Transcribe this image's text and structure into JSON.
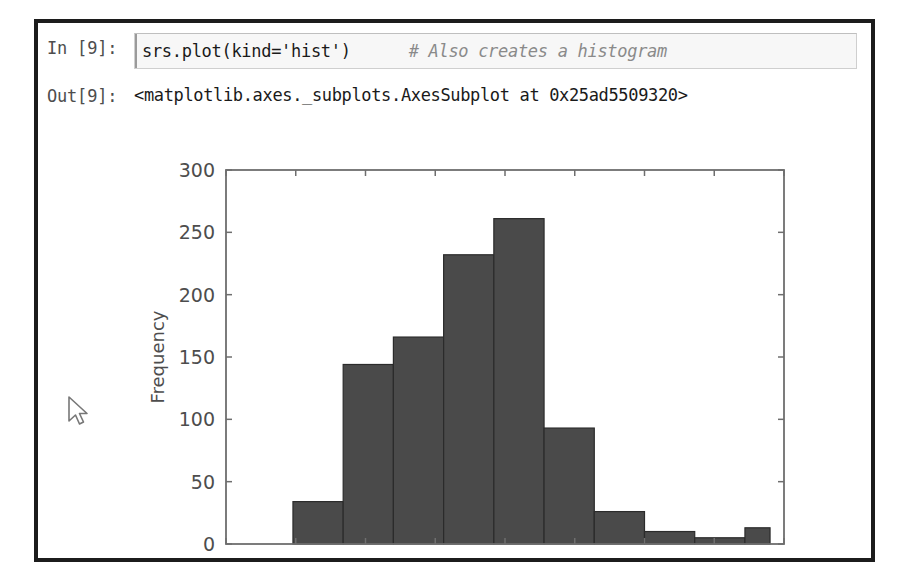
{
  "notebook": {
    "input": {
      "prompt": "In [9]:",
      "code": "srs.plot(kind='hist')",
      "comment": "# Also creates a histogram"
    },
    "output": {
      "prompt": "Out[9]:",
      "text": "<matplotlib.axes._subplots.AxesSubplot at 0x25ad5509320>"
    }
  },
  "cursor": {
    "icon": "mouse-pointer-icon"
  },
  "colors": {
    "bar_fill": "#4a4a4a",
    "bar_edge": "#2b2b2b",
    "axis": "#6e6e6e",
    "frame": "#1c1c1c",
    "comment": "#8a8a8a"
  },
  "chart_data": {
    "type": "bar",
    "title": "",
    "xlabel": "",
    "ylabel": "Frequency",
    "xlim": [
      -10,
      30
    ],
    "ylim": [
      0,
      300
    ],
    "xticks": [
      "-10",
      "-5",
      "0",
      "5",
      "10",
      "15",
      "20",
      "25",
      "30"
    ],
    "xtick_values": [
      -10,
      -5,
      0,
      5,
      10,
      15,
      20,
      25,
      30
    ],
    "yticks": [
      "0",
      "50",
      "100",
      "150",
      "200",
      "250",
      "300"
    ],
    "ytick_values": [
      0,
      50,
      100,
      150,
      200,
      250,
      300
    ],
    "grid": false,
    "legend": false,
    "bin_edges": [
      -5.2,
      -1.6,
      2.0,
      5.6,
      9.2,
      12.8,
      16.4,
      20.0,
      23.6,
      27.2,
      29.0
    ],
    "bins": [
      {
        "x0": -5.2,
        "x1": -1.6,
        "value": 34
      },
      {
        "x0": -1.6,
        "x1": 2.0,
        "value": 144
      },
      {
        "x0": 2.0,
        "x1": 5.6,
        "value": 166
      },
      {
        "x0": 5.6,
        "x1": 9.2,
        "value": 232
      },
      {
        "x0": 9.2,
        "x1": 12.8,
        "value": 261
      },
      {
        "x0": 12.8,
        "x1": 16.4,
        "value": 93
      },
      {
        "x0": 16.4,
        "x1": 20.0,
        "value": 26
      },
      {
        "x0": 20.0,
        "x1": 23.6,
        "value": 10
      },
      {
        "x0": 23.6,
        "x1": 27.2,
        "value": 5
      },
      {
        "x0": 27.2,
        "x1": 29.0,
        "value": 13
      }
    ],
    "values": [
      34,
      144,
      166,
      232,
      261,
      93,
      26,
      10,
      5,
      13
    ]
  }
}
